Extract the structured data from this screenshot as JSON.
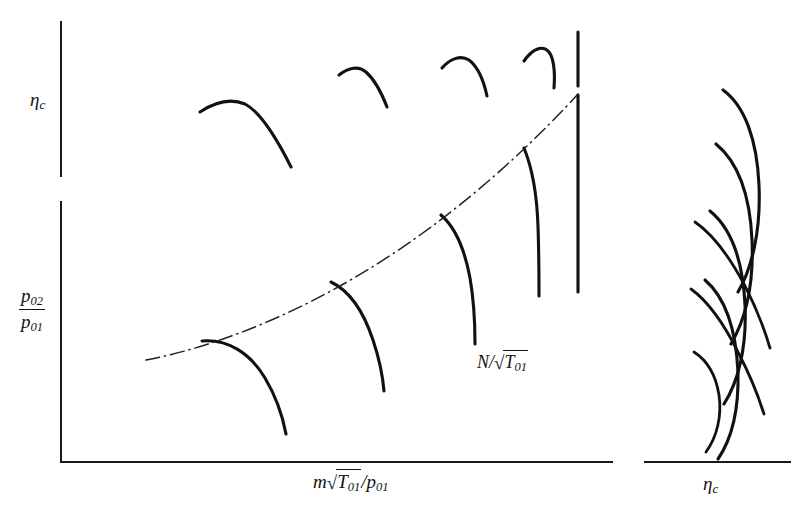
{
  "figure": {
    "kind": "compressor-characteristic-diagram",
    "background_color": "#ffffff",
    "ink_color": "#111111"
  },
  "left_panel": {
    "upper_axis": {
      "name": "efficiency-axis",
      "label_plain": "ηc"
    },
    "lower_axis": {
      "name": "pressure-ratio-axis",
      "label_plain": "p02/p01"
    },
    "x_axis": {
      "name": "mass-flow-axis",
      "label_plain": "m√T01/p01"
    },
    "labels": {
      "eta_symbol": "η",
      "eta_subscript": "c",
      "pressure_numerator_symbol": "p",
      "pressure_numerator_subscript": "02",
      "pressure_denominator_symbol": "p",
      "pressure_denominator_subscript": "01",
      "massflow_symbol": "m",
      "massflow_radicand_symbol": "T",
      "massflow_radicand_subscript": "01",
      "massflow_divider": "/",
      "massflow_denominator_symbol": "p",
      "massflow_denominator_subscript": "01",
      "speed_symbol": "N",
      "speed_divider": "/",
      "speed_radicand_symbol": "T",
      "speed_radicand_subscript": "01",
      "sqrt_glyph": "√"
    }
  },
  "right_panel": {
    "x_axis": {
      "name": "efficiency-axis-right",
      "label_plain": "ηc"
    },
    "labels": {
      "eta_symbol": "η",
      "eta_subscript": "c"
    }
  },
  "chart_data": {
    "type": "line",
    "title": "",
    "subtitle": "",
    "xlabel": "m√T01/p01",
    "ylabel_upper": "ηc",
    "ylabel_lower": "p02/p01",
    "grid": false,
    "legend": null,
    "annotations": [
      {
        "text": "N/√T01",
        "x": 497,
        "y": 362,
        "describes": "constant-speed-lines"
      },
      {
        "text": "ηc",
        "x": 712,
        "y": 485,
        "describes": "right-panel-x-axis"
      }
    ],
    "axes": [
      {
        "name": "upper-left-y-axis",
        "orientation": "vertical",
        "x": 61,
        "y1": 22,
        "y2": 176
      },
      {
        "name": "lower-left-y-axis",
        "orientation": "vertical",
        "x": 61,
        "y1": 202,
        "y2": 462
      },
      {
        "name": "left-x-axis",
        "orientation": "horizontal",
        "y": 462,
        "x1": 61,
        "x2": 612
      },
      {
        "name": "right-x-axis",
        "orientation": "horizontal",
        "y": 462,
        "x1": 645,
        "x2": 790
      }
    ],
    "series": [
      {
        "name": "efficiency-speed-line-1",
        "panel": "upper-left",
        "speed_rank": 1,
        "path": "M 200,112 C 218,100 233,99 245,104 C 262,113 278,141 291,167"
      },
      {
        "name": "efficiency-speed-line-2",
        "panel": "upper-left",
        "speed_rank": 2,
        "path": "M 339,75 C 349,67 359,66 366,72 C 375,80 382,94 387,107"
      },
      {
        "name": "efficiency-speed-line-3",
        "panel": "upper-left",
        "speed_rank": 3,
        "path": "M 442,68 C 451,58 461,55 469,60 C 478,67 484,82 487,96"
      },
      {
        "name": "efficiency-speed-line-4",
        "panel": "upper-left",
        "speed_rank": 4,
        "path": "M 524,61 C 533,48 543,45 549,52 C 554,59 555,74 554,88"
      },
      {
        "name": "efficiency-speed-line-5",
        "panel": "upper-left",
        "speed_rank": 5,
        "path": "M 578,32 L 578,86"
      },
      {
        "name": "pressure-speed-line-1",
        "panel": "lower-left",
        "speed_rank": 1,
        "path": "M 202,341 C 228,339 250,353 265,378 C 277,398 283,418 286,434"
      },
      {
        "name": "pressure-speed-line-2",
        "panel": "lower-left",
        "speed_rank": 2,
        "path": "M 331,282 C 350,291 364,313 373,340 C 380,361 383,379 384,391"
      },
      {
        "name": "pressure-speed-line-3",
        "panel": "lower-left",
        "speed_rank": 3,
        "path": "M 441,215 C 456,228 465,251 470,278 C 474,301 475,325 475,344"
      },
      {
        "name": "pressure-speed-line-4",
        "panel": "lower-left",
        "speed_rank": 4,
        "path": "M 524,148 C 533,170 537,197 538,226 C 539,255 539,280 539,296"
      },
      {
        "name": "pressure-speed-line-5",
        "panel": "lower-left",
        "speed_rank": 5,
        "path": "M 578,95 L 578,292"
      },
      {
        "name": "surge-line",
        "panel": "lower-left",
        "style": "chain-dotted",
        "path": "M 146,360 C 230,344 330,300 420,235 C 490,185 545,130 578,94"
      },
      {
        "name": "right-efficiency-curve-1",
        "panel": "right",
        "path": "M 723,90 C 745,106 757,140 759,185 C 761,231 752,268 738,292"
      },
      {
        "name": "right-efficiency-curve-2",
        "panel": "right",
        "path": "M 716,144 C 738,162 750,196 752,240 C 754,285 745,320 731,344"
      },
      {
        "name": "right-efficiency-curve-3",
        "panel": "right",
        "path": "M 710,211 C 732,229 743,262 745,305 C 747,348 738,382 724,404"
      },
      {
        "name": "right-efficiency-curve-4",
        "panel": "right",
        "path": "M 705,280 C 726,298 736,330 738,372 C 739,412 731,440 718,459"
      },
      {
        "name": "right-speed-line-1",
        "panel": "right",
        "path": "M 695,222 C 714,235 730,258 744,284 C 757,309 765,331 770,348"
      },
      {
        "name": "right-speed-line-2",
        "panel": "right",
        "path": "M 691,289 C 709,302 725,326 738,352 C 751,377 759,398 764,414"
      },
      {
        "name": "right-speed-line-3",
        "panel": "right",
        "path": "M 694,352 C 708,361 716,376 719,395 C 722,416 717,437 706,452"
      }
    ]
  }
}
